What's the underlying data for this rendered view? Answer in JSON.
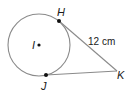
{
  "diagram": {
    "type": "circle-tangent-segments",
    "circle": {
      "center_label": "I",
      "cx": 39,
      "cy": 45,
      "r": 31
    },
    "points": {
      "H": {
        "label": "H",
        "x": 59,
        "y": 21
      },
      "J": {
        "label": "J",
        "x": 46,
        "y": 75
      },
      "K": {
        "label": "K",
        "x": 117,
        "y": 71
      }
    },
    "segments": [
      {
        "from": "H",
        "to": "K",
        "label": "12 cm"
      },
      {
        "from": "J",
        "to": "K",
        "label": ""
      }
    ],
    "measure_label": "12 cm",
    "stroke_color": "#8a8a8a",
    "point_color": "#111111"
  }
}
